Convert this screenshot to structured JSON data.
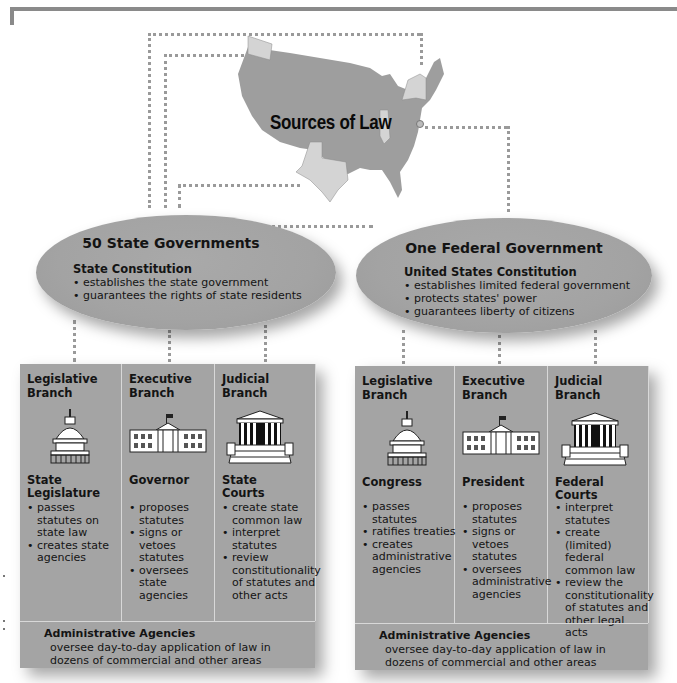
{
  "title": "Sources of Law",
  "colors": {
    "map_fill": "#9e9e9e",
    "highlight_state": "#d4d4d4",
    "box_fill": "#a4a4a4",
    "oval_fill": "#a6a6a6",
    "connector": "#9a9a9a",
    "frame": "#8a8a8a"
  },
  "state": {
    "oval_title": "50 State Governments",
    "constitution": "State Constitution",
    "constitution_points": [
      "establishes the state government",
      "guarantees the rights of state residents"
    ],
    "branches": [
      {
        "branch": "Legislative Branch",
        "icon": "capitol-dome-icon",
        "role": "State Legislature",
        "duties": [
          "passes statutes on state law",
          "creates state agencies"
        ]
      },
      {
        "branch": "Executive Branch",
        "icon": "governor-mansion-icon",
        "role": "Governor",
        "duties": [
          "proposes statutes",
          "signs or vetoes statutes",
          "oversees state agencies"
        ]
      },
      {
        "branch": "Judicial Branch",
        "icon": "courthouse-icon",
        "role": "State Courts",
        "duties": [
          "create state common law",
          "interpret statutes",
          "review constitutionality of statutes and other acts"
        ]
      }
    ],
    "admin_title": "Administrative Agencies",
    "admin_desc": "oversee day-to-day application of law in dozens of commercial and other areas"
  },
  "federal": {
    "oval_title": "One Federal Government",
    "constitution": "United States Constitution",
    "constitution_points": [
      "establishes limited federal government",
      "protects states' power",
      "guarantees liberty of citizens"
    ],
    "branches": [
      {
        "branch": "Legislative Branch",
        "icon": "capitol-dome-icon",
        "role": "Congress",
        "duties": [
          "passes statutes",
          "ratifies treaties",
          "creates administrative agencies"
        ]
      },
      {
        "branch": "Executive Branch",
        "icon": "white-house-icon",
        "role": "President",
        "duties": [
          "proposes statutes",
          "signs or vetoes statutes",
          "oversees administrative agencies"
        ]
      },
      {
        "branch": "Judicial Branch",
        "icon": "supreme-court-icon",
        "role": "Federal Courts",
        "duties": [
          "interpret statutes",
          "create (limited) federal common law",
          "review the constitutionality of statutes and other legal acts"
        ]
      }
    ],
    "admin_title": "Administrative Agencies",
    "admin_desc": "oversee day-to-day application of law in dozens of commercial and other areas"
  }
}
